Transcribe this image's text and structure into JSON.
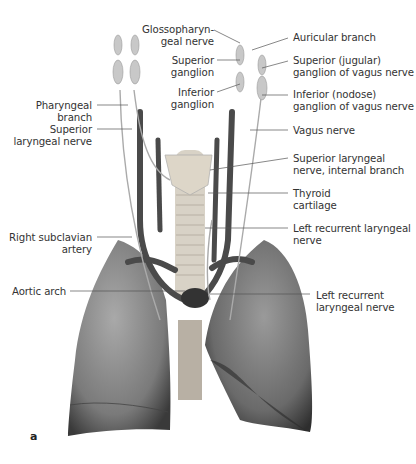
{
  "figure": {
    "panel_label": "a",
    "labels_left": [
      {
        "id": "glossopharyngeal",
        "line1": "Glossopharyn-",
        "line2": "geal nerve"
      },
      {
        "id": "superior-ganglion",
        "line1": "Superior",
        "line2": "ganglion"
      },
      {
        "id": "inferior-ganglion",
        "line1": "Inferior",
        "line2": "ganglion"
      },
      {
        "id": "pharyngeal-branch",
        "line1": "Pharyngeal",
        "line2": "branch"
      },
      {
        "id": "superior-laryngeal",
        "line1": "Superior",
        "line2": "laryngeal nerve"
      },
      {
        "id": "right-subclavian",
        "line1": "Right subclavian",
        "line2": "artery"
      },
      {
        "id": "aortic-arch",
        "line1": "Aortic arch",
        "line2": ""
      }
    ],
    "labels_right": [
      {
        "id": "auricular-branch",
        "line1": "Auricular branch",
        "line2": ""
      },
      {
        "id": "superior-jugular",
        "line1": "Superior (jugular)",
        "line2": "ganglion of vagus nerve"
      },
      {
        "id": "inferior-nodose",
        "line1": "Inferior (nodose)",
        "line2": "ganglion of vagus nerve"
      },
      {
        "id": "vagus-nerve",
        "line1": "Vagus nerve",
        "line2": ""
      },
      {
        "id": "sup-laryngeal-internal",
        "line1": "Superior laryngeal",
        "line2": "nerve, internal branch"
      },
      {
        "id": "thyroid-cartilage",
        "line1": "Thyroid",
        "line2": "cartilage"
      },
      {
        "id": "left-recurrent-1",
        "line1": "Left recurrent laryngeal",
        "line2": "nerve"
      },
      {
        "id": "left-recurrent-2",
        "line1": "Left recurrent",
        "line2": "laryngeal nerve"
      }
    ]
  }
}
